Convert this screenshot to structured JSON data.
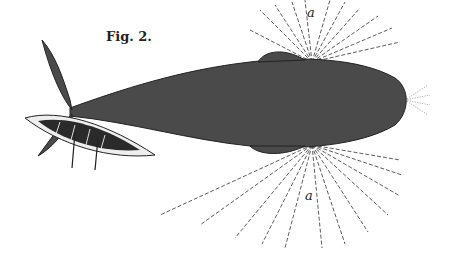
{
  "figure": {
    "caption": "Fig. 2.",
    "labels": [
      "a",
      "a"
    ]
  }
}
